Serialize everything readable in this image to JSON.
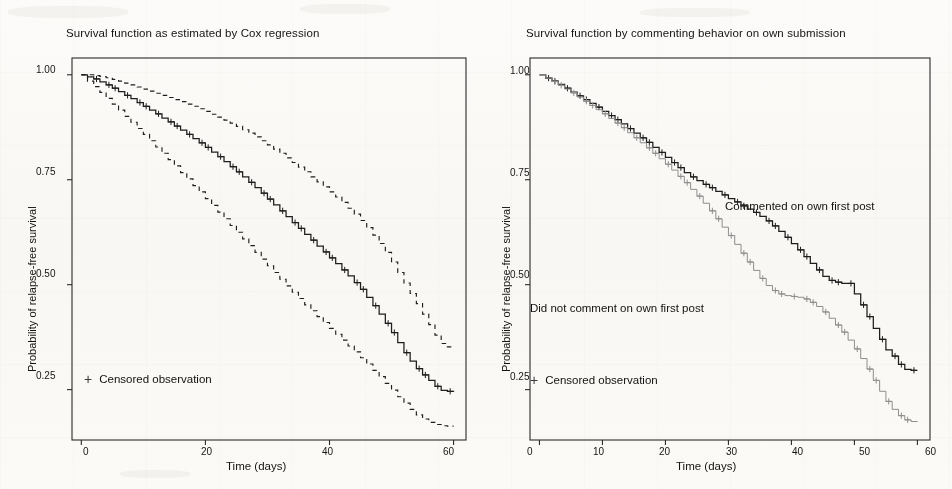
{
  "figure": {
    "background_color": "#fbfaf8",
    "ink_color": "#141414"
  },
  "panels": [
    {
      "id": "left",
      "title": "Survival function as estimated by Cox regression",
      "xlabel": "Time (days)",
      "ylabel": "Probability of relapse-free survival",
      "legend_label": "Censored observation",
      "legend_marker": "plus-icon",
      "xticks": [
        "0",
        "20",
        "40",
        "60"
      ],
      "yticks": [
        "1.00",
        "0.75",
        "0.50",
        "0.25"
      ]
    },
    {
      "id": "right",
      "title": "Survival function by commenting behavior on own submission",
      "xlabel": "Time (days)",
      "ylabel": "Probability of relapse-free survival",
      "legend_label": "Censored observation",
      "legend_marker": "plus-icon",
      "xticks": [
        "0",
        "10",
        "20",
        "30",
        "40",
        "50",
        "60"
      ],
      "yticks": [
        "1.00",
        "0.75",
        "0.50",
        "0.25"
      ],
      "annotations": [
        "Commented on own first post",
        "Did not comment on own first post"
      ]
    }
  ],
  "chart_data": [
    {
      "type": "line",
      "id": "cox-survival",
      "title": "Survival function as estimated by Cox regression",
      "xlabel": "Time (days)",
      "ylabel": "Probability of relapse-free survival",
      "xlim": [
        -1.5,
        62
      ],
      "ylim": [
        0.13,
        1.04
      ],
      "xticks": [
        0,
        20,
        40,
        60
      ],
      "yticks": [
        0.25,
        0.5,
        0.75,
        1.0
      ],
      "grid": false,
      "legend_position": "bottom-left",
      "series": [
        {
          "name": "Estimated survival",
          "style": "step-solid",
          "x": [
            0,
            1,
            2,
            3,
            4,
            5,
            6,
            7,
            8,
            9,
            10,
            11,
            12,
            13,
            14,
            15,
            16,
            17,
            18,
            19,
            20,
            21,
            22,
            23,
            24,
            25,
            26,
            27,
            28,
            29,
            30,
            31,
            32,
            33,
            34,
            35,
            36,
            37,
            38,
            39,
            40,
            41,
            42,
            43,
            44,
            45,
            46,
            47,
            48,
            49,
            50,
            51,
            52,
            53,
            54,
            55,
            56,
            57,
            58,
            59,
            60
          ],
          "y": [
            1.0,
            0.995,
            0.99,
            0.983,
            0.976,
            0.968,
            0.96,
            0.951,
            0.943,
            0.934,
            0.925,
            0.916,
            0.907,
            0.897,
            0.888,
            0.878,
            0.868,
            0.858,
            0.848,
            0.838,
            0.827,
            0.816,
            0.805,
            0.793,
            0.781,
            0.769,
            0.757,
            0.744,
            0.731,
            0.718,
            0.704,
            0.69,
            0.676,
            0.662,
            0.648,
            0.634,
            0.62,
            0.606,
            0.592,
            0.578,
            0.564,
            0.55,
            0.535,
            0.521,
            0.505,
            0.489,
            0.47,
            0.45,
            0.43,
            0.408,
            0.386,
            0.362,
            0.338,
            0.318,
            0.3,
            0.285,
            0.272,
            0.258,
            0.248,
            0.246,
            0.245
          ]
        },
        {
          "name": "Upper 95% confidence limit",
          "style": "step-dashed",
          "x": [
            0,
            1,
            2,
            3,
            4,
            5,
            6,
            7,
            8,
            9,
            10,
            11,
            12,
            13,
            14,
            15,
            16,
            17,
            18,
            19,
            20,
            21,
            22,
            23,
            24,
            25,
            26,
            27,
            28,
            29,
            30,
            31,
            32,
            33,
            34,
            35,
            36,
            37,
            38,
            39,
            40,
            41,
            42,
            43,
            44,
            45,
            46,
            47,
            48,
            49,
            50,
            51,
            52,
            53,
            54,
            55,
            56,
            57,
            58,
            59,
            60
          ],
          "y": [
            1.0,
            1.0,
            0.998,
            0.996,
            0.993,
            0.989,
            0.985,
            0.98,
            0.976,
            0.971,
            0.966,
            0.961,
            0.956,
            0.951,
            0.946,
            0.941,
            0.936,
            0.93,
            0.925,
            0.919,
            0.913,
            0.906,
            0.899,
            0.892,
            0.885,
            0.877,
            0.869,
            0.861,
            0.852,
            0.843,
            0.833,
            0.823,
            0.813,
            0.802,
            0.791,
            0.78,
            0.769,
            0.757,
            0.745,
            0.733,
            0.721,
            0.709,
            0.696,
            0.682,
            0.668,
            0.653,
            0.636,
            0.618,
            0.598,
            0.577,
            0.554,
            0.529,
            0.504,
            0.479,
            0.455,
            0.43,
            0.405,
            0.38,
            0.36,
            0.352,
            0.35
          ]
        },
        {
          "name": "Lower 95% confidence limit",
          "style": "step-dashed",
          "x": [
            0,
            1,
            2,
            3,
            4,
            5,
            6,
            7,
            8,
            9,
            10,
            11,
            12,
            13,
            14,
            15,
            16,
            17,
            18,
            19,
            20,
            21,
            22,
            23,
            24,
            25,
            26,
            27,
            28,
            29,
            30,
            31,
            32,
            33,
            34,
            35,
            36,
            37,
            38,
            39,
            40,
            41,
            42,
            43,
            44,
            45,
            46,
            47,
            48,
            49,
            50,
            51,
            52,
            53,
            54,
            55,
            56,
            57,
            58,
            59,
            60
          ],
          "y": [
            1.0,
            0.985,
            0.972,
            0.958,
            0.944,
            0.93,
            0.916,
            0.901,
            0.887,
            0.872,
            0.858,
            0.843,
            0.828,
            0.813,
            0.798,
            0.783,
            0.767,
            0.752,
            0.736,
            0.721,
            0.705,
            0.689,
            0.673,
            0.657,
            0.641,
            0.625,
            0.609,
            0.593,
            0.577,
            0.561,
            0.545,
            0.529,
            0.513,
            0.497,
            0.482,
            0.467,
            0.452,
            0.438,
            0.424,
            0.41,
            0.396,
            0.382,
            0.368,
            0.354,
            0.34,
            0.326,
            0.311,
            0.296,
            0.281,
            0.265,
            0.249,
            0.233,
            0.218,
            0.203,
            0.19,
            0.18,
            0.172,
            0.167,
            0.164,
            0.163,
            0.163
          ]
        }
      ]
    },
    {
      "type": "line",
      "id": "commenting-behavior-survival",
      "title": "Survival function by commenting behavior on own submission",
      "xlabel": "Time (days)",
      "ylabel": "Probability of relapse-free survival",
      "xlim": [
        -1.5,
        62
      ],
      "ylim": [
        0.13,
        1.04
      ],
      "xticks": [
        0,
        10,
        20,
        30,
        40,
        50,
        60
      ],
      "yticks": [
        0.25,
        0.5,
        0.75,
        1.0
      ],
      "grid": false,
      "legend_position": "bottom-left",
      "series": [
        {
          "name": "Commented on own first post",
          "style": "step-solid",
          "x": [
            0,
            1,
            2,
            3,
            4,
            5,
            6,
            7,
            8,
            9,
            10,
            11,
            12,
            13,
            14,
            15,
            16,
            17,
            18,
            19,
            20,
            21,
            22,
            23,
            24,
            25,
            26,
            27,
            28,
            29,
            30,
            31,
            32,
            33,
            34,
            35,
            36,
            37,
            38,
            39,
            40,
            41,
            42,
            43,
            44,
            45,
            46,
            47,
            48,
            49,
            50,
            51,
            52,
            53,
            54,
            55,
            56,
            57,
            58,
            59,
            60
          ],
          "y": [
            1.0,
            0.992,
            0.985,
            0.977,
            0.968,
            0.959,
            0.95,
            0.941,
            0.932,
            0.923,
            0.913,
            0.903,
            0.893,
            0.883,
            0.872,
            0.861,
            0.85,
            0.839,
            0.827,
            0.815,
            0.803,
            0.791,
            0.779,
            0.767,
            0.757,
            0.748,
            0.739,
            0.731,
            0.722,
            0.714,
            0.705,
            0.697,
            0.688,
            0.68,
            0.672,
            0.663,
            0.652,
            0.64,
            0.627,
            0.613,
            0.598,
            0.583,
            0.567,
            0.551,
            0.535,
            0.52,
            0.51,
            0.506,
            0.503,
            0.503,
            0.478,
            0.452,
            0.424,
            0.396,
            0.37,
            0.345,
            0.33,
            0.31,
            0.298,
            0.296,
            0.296
          ]
        },
        {
          "name": "Did not comment on own first post",
          "style": "step-solid-light",
          "x": [
            0,
            1,
            2,
            3,
            4,
            5,
            6,
            7,
            8,
            9,
            10,
            11,
            12,
            13,
            14,
            15,
            16,
            17,
            18,
            19,
            20,
            21,
            22,
            23,
            24,
            25,
            26,
            27,
            28,
            29,
            30,
            31,
            32,
            33,
            34,
            35,
            36,
            37,
            38,
            39,
            40,
            41,
            42,
            43,
            44,
            45,
            46,
            47,
            48,
            49,
            50,
            51,
            52,
            53,
            54,
            55,
            56,
            57,
            58,
            59,
            60
          ],
          "y": [
            1.0,
            0.992,
            0.984,
            0.975,
            0.966,
            0.957,
            0.947,
            0.937,
            0.927,
            0.917,
            0.907,
            0.896,
            0.885,
            0.874,
            0.862,
            0.85,
            0.838,
            0.826,
            0.813,
            0.8,
            0.787,
            0.773,
            0.758,
            0.743,
            0.727,
            0.711,
            0.694,
            0.676,
            0.657,
            0.637,
            0.617,
            0.596,
            0.575,
            0.554,
            0.534,
            0.515,
            0.498,
            0.486,
            0.478,
            0.474,
            0.472,
            0.47,
            0.466,
            0.458,
            0.448,
            0.435,
            0.42,
            0.404,
            0.387,
            0.368,
            0.347,
            0.324,
            0.299,
            0.272,
            0.246,
            0.222,
            0.203,
            0.188,
            0.178,
            0.174,
            0.173
          ]
        }
      ]
    }
  ]
}
